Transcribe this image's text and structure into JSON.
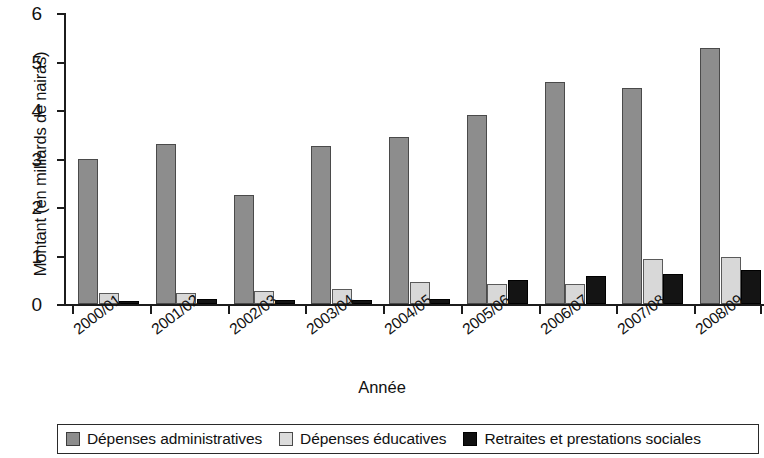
{
  "chart_data": {
    "type": "bar",
    "title": "",
    "xlabel": "Année",
    "ylabel": "Montant (en milliards de nairas)",
    "categories": [
      "2000/01",
      "2001/02",
      "2002/03",
      "2003/04",
      "2004/05",
      "2005/06",
      "2006/07",
      "2007/08",
      "2008/09"
    ],
    "series": [
      {
        "name": "Dépenses administratives",
        "color": "#8d8d8d",
        "values": [
          3.0,
          3.3,
          2.25,
          3.25,
          3.45,
          3.9,
          4.57,
          4.45,
          5.28
        ]
      },
      {
        "name": "Dépenses éducatives",
        "color": "#d8d8d8",
        "values": [
          0.23,
          0.23,
          0.26,
          0.31,
          0.45,
          0.41,
          0.42,
          0.93,
          0.97
        ]
      },
      {
        "name": "Retraites et prestations sociales",
        "color": "#141414",
        "values": [
          0.07,
          0.1,
          0.08,
          0.09,
          0.1,
          0.5,
          0.57,
          0.62,
          0.7
        ]
      }
    ],
    "ylim": [
      0,
      6
    ],
    "yticks": [
      "0",
      "1",
      "2",
      "3",
      "4",
      "5",
      "6"
    ],
    "grid": false,
    "legend_position": "bottom"
  },
  "legend": {
    "items": [
      {
        "label": "Dépenses administratives",
        "swatch": "dark-gray-swatch"
      },
      {
        "label": "Dépenses éducatives",
        "swatch": "light-gray-swatch"
      },
      {
        "label": "Retraites et prestations sociales",
        "swatch": "black-swatch"
      }
    ]
  }
}
